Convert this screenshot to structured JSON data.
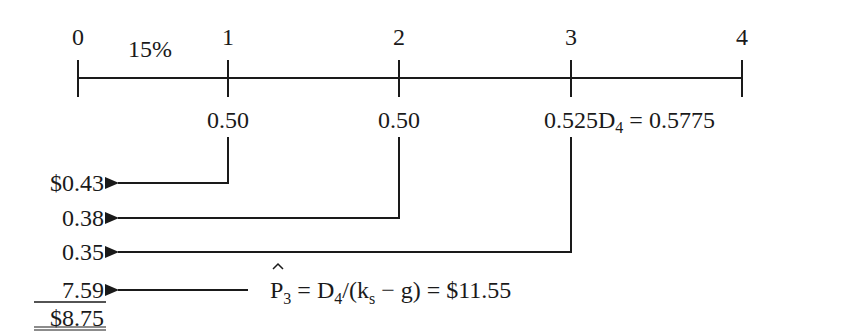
{
  "timeline": {
    "periods": [
      "0",
      "1",
      "2",
      "3",
      "4"
    ],
    "rate_label": "15%",
    "cash_flows": [
      "0.50",
      "0.50",
      "0.525"
    ],
    "d4_label": "D",
    "d4_sub": "4",
    "d4_value": " = 0.5775"
  },
  "present_values": {
    "pv1": "$0.43",
    "pv2": "0.38",
    "pv3": "0.35",
    "pv_terminal": "7.59",
    "total": "$8.75"
  },
  "terminal_formula": {
    "p": "P",
    "p_sub": "3",
    "eq1": " = D",
    "d_sub": "4",
    "mid": "/(k",
    "k_sub": "s",
    "tail": " − g) = $11.55"
  }
}
